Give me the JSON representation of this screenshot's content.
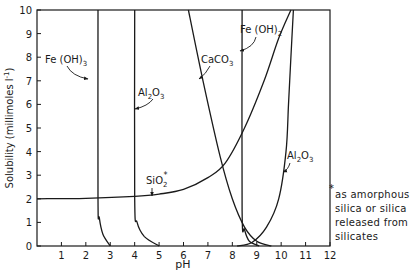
{
  "chart_data": {
    "type": "line",
    "title": "",
    "xlabel": "pH",
    "ylabel": "Solubility (millimoles l⁻¹)",
    "xlim": [
      0,
      12
    ],
    "ylim": [
      0,
      10
    ],
    "x_ticks": [
      "1",
      "2",
      "3",
      "4",
      "5",
      "6",
      "7",
      "8",
      "9",
      "10",
      "11",
      "12"
    ],
    "y_ticks": [
      "0",
      "1",
      "2",
      "3",
      "4",
      "5",
      "6",
      "7",
      "8",
      "9",
      "10"
    ],
    "grid": false,
    "legend": "inline labels with arrows",
    "series": [
      {
        "name": "Fe(OH)3",
        "points": [
          [
            2.5,
            10
          ],
          [
            2.5,
            2.0
          ],
          [
            2.55,
            1.2
          ],
          [
            2.7,
            0.5
          ],
          [
            3.0,
            0
          ]
        ]
      },
      {
        "name": "Al2O3 (acid side)",
        "points": [
          [
            4.0,
            10
          ],
          [
            4.0,
            2.0
          ],
          [
            4.1,
            1.0
          ],
          [
            4.4,
            0.4
          ],
          [
            5.0,
            0
          ]
        ]
      },
      {
        "name": "CaCO3",
        "points": [
          [
            6.2,
            10
          ],
          [
            6.8,
            7.0
          ],
          [
            7.5,
            3.8
          ],
          [
            8.0,
            2.0
          ],
          [
            8.5,
            0.8
          ],
          [
            9.0,
            0.2
          ],
          [
            9.6,
            0
          ]
        ]
      },
      {
        "name": "Fe(OH)2",
        "points": [
          [
            8.4,
            10
          ],
          [
            8.4,
            1.5
          ],
          [
            8.5,
            0.7
          ],
          [
            8.7,
            0.2
          ],
          [
            9.1,
            0
          ]
        ]
      },
      {
        "name": "Al2O3 (alkaline side)",
        "points": [
          [
            8.2,
            0
          ],
          [
            8.8,
            0.15
          ],
          [
            9.4,
            0.8
          ],
          [
            9.9,
            2.0
          ],
          [
            10.2,
            4.0
          ],
          [
            10.3,
            6.0
          ],
          [
            10.4,
            8.0
          ],
          [
            10.5,
            10
          ]
        ]
      },
      {
        "name": "SiO2*",
        "points": [
          [
            0,
            2.0
          ],
          [
            2,
            2.02
          ],
          [
            4,
            2.1
          ],
          [
            5,
            2.2
          ],
          [
            6,
            2.4
          ],
          [
            7,
            2.9
          ],
          [
            7.7,
            3.5
          ],
          [
            8.5,
            5.0
          ],
          [
            9.3,
            7.0
          ],
          [
            9.9,
            8.8
          ],
          [
            10.4,
            10
          ]
        ]
      }
    ],
    "annotations": [
      {
        "text": "Fe(OH)3",
        "target_series": "Fe(OH)3"
      },
      {
        "text": "Al2O3",
        "target_series": "Al2O3 (acid side)"
      },
      {
        "text": "CaCO3",
        "target_series": "CaCO3"
      },
      {
        "text": "Fe(OH)2",
        "target_series": "Fe(OH)2"
      },
      {
        "text": "SiO2*",
        "target_series": "SiO2*"
      },
      {
        "text": "Al2O3",
        "target_series": "Al2O3 (alkaline side)"
      }
    ],
    "footnote": [
      "*",
      "as amorphous",
      "silica or silica",
      "released from",
      "silicates"
    ]
  },
  "labels": {
    "fe3": "Fe (OH)",
    "fe3_sub": "3",
    "al_a": "Al",
    "al_sub1": "2",
    "al_b": "O",
    "al_sub2": "3",
    "caco": "CaCO",
    "caco_sub": "3",
    "fe2": "Fe (OH)",
    "fe2_sub": "2",
    "si": "SiO",
    "si_sub": "2",
    "si_star": "*",
    "xlabel": "pH",
    "ylabel": "Solubility (millimoles l",
    "ylabel_sup": "-1",
    "ylabel_end": ")"
  },
  "note": {
    "star": "*",
    "lines": [
      "as amorphous",
      "silica or silica",
      "released from",
      "silicates"
    ]
  }
}
